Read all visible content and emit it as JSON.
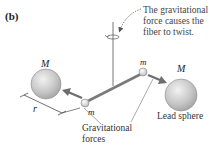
{
  "figure": {
    "panel_label": "(b)",
    "annotation": {
      "line1": "The gravitational",
      "line2": "force causes the",
      "line3": "fiber to twist."
    },
    "labels": {
      "large_mass_left": "M",
      "large_mass_right": "M",
      "small_mass_left": "m",
      "small_mass_right": "m",
      "distance": "r",
      "forces_line1": "Gravitational",
      "forces_line2": "forces",
      "lead_sphere": "Lead sphere"
    },
    "colors": {
      "sphere_fill": "#c8c8c8",
      "rod": "#7a7a7a",
      "arrow": "#6e6e6e",
      "text": "#222222",
      "dotted": "#555555"
    }
  }
}
